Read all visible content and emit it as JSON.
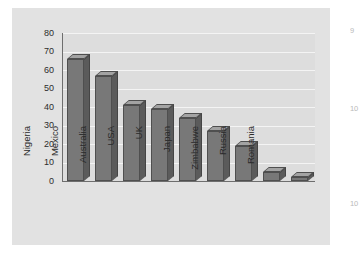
{
  "chart_data": {
    "type": "bar",
    "title": "",
    "subtitle": "",
    "xlabel": "",
    "ylabel": "Very happy people (per cent)",
    "categories": [
      "Nigeria",
      "Mexico",
      "Australia",
      "USA",
      "UK",
      "Japan",
      "Zimbabwe",
      "Russia",
      "Romania"
    ],
    "values": [
      66,
      57,
      41,
      39,
      34,
      27,
      19,
      5,
      2
    ],
    "ylim": [
      0,
      80
    ],
    "ytick_labels": [
      "80",
      "70",
      "60",
      "50",
      "40",
      "30",
      "20",
      "10",
      "0"
    ],
    "ytick_values": [
      80,
      70,
      60,
      50,
      40,
      30,
      20,
      10,
      0
    ],
    "grid": "horizontal",
    "legend": "none",
    "style": "3d-bars",
    "colors": {
      "bar_front": "#787878",
      "bar_side": "#5b5b5b",
      "bar_top": "#a3a3a3",
      "plot_background": "#dddddd",
      "panel_background": "#e2e2e2",
      "gridline": "#f4f4f4",
      "axis": "#6e6e6e",
      "text": "#2a2a2a"
    }
  },
  "page_margin": {
    "artifacts": [
      "9",
      "10",
      "10"
    ]
  }
}
